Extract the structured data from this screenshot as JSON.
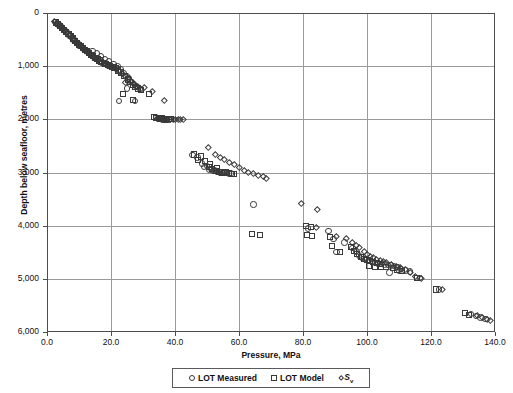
{
  "chart_data": {
    "type": "scatter",
    "title": "",
    "xlabel": "Pressure, MPa",
    "ylabel": "Depth below seafloor, metres",
    "xlim": [
      0,
      140
    ],
    "ylim": [
      0,
      6000
    ],
    "y_inverted": true,
    "grid": true,
    "legend_position": "bottom",
    "xticks": [
      "0.0",
      "20.0",
      "40.0",
      "60.0",
      "80.0",
      "100.0",
      "120.0",
      "140.0"
    ],
    "xtick_values": [
      0,
      20,
      40,
      60,
      80,
      100,
      120,
      140
    ],
    "yticks": [
      "0",
      "1,000",
      "2,000",
      "3,000",
      "4,000",
      "5,000",
      "6,000"
    ],
    "ytick_values": [
      0,
      1000,
      2000,
      3000,
      4000,
      5000,
      6000
    ],
    "series": [
      {
        "name": "LOT Measured",
        "marker": "circle",
        "points": [
          [
            2.6,
            170
          ],
          [
            3.1,
            200
          ],
          [
            3.6,
            215
          ],
          [
            4.3,
            250
          ],
          [
            5.0,
            300
          ],
          [
            5.6,
            330
          ],
          [
            6.3,
            360
          ],
          [
            7.0,
            420
          ],
          [
            7.6,
            455
          ],
          [
            8.3,
            500
          ],
          [
            9.0,
            540
          ],
          [
            9.6,
            575
          ],
          [
            10.2,
            610
          ],
          [
            10.9,
            640
          ],
          [
            11.5,
            680
          ],
          [
            12.1,
            700
          ],
          [
            12.8,
            735
          ],
          [
            13.4,
            770
          ],
          [
            14.0,
            800
          ],
          [
            14.7,
            830
          ],
          [
            15.3,
            855
          ],
          [
            16.0,
            880
          ],
          [
            16.6,
            905
          ],
          [
            17.2,
            930
          ],
          [
            17.9,
            950
          ],
          [
            18.5,
            965
          ],
          [
            19.2,
            985
          ],
          [
            19.8,
            1000
          ],
          [
            20.5,
            1015
          ],
          [
            21.1,
            1030
          ],
          [
            14.2,
            720
          ],
          [
            15.6,
            760
          ],
          [
            16.9,
            820
          ],
          [
            18.1,
            870
          ],
          [
            19.4,
            915
          ],
          [
            20.8,
            960
          ],
          [
            22.0,
            1005
          ],
          [
            23.0,
            1060
          ],
          [
            24.0,
            1130
          ],
          [
            24.8,
            1180
          ],
          [
            25.6,
            1230
          ],
          [
            26.4,
            1300
          ],
          [
            25.0,
            1420
          ],
          [
            27.2,
            1340
          ],
          [
            28.0,
            1380
          ],
          [
            29.0,
            1430
          ],
          [
            22.5,
            1650
          ],
          [
            27.5,
            1660
          ],
          [
            34.0,
            1960
          ],
          [
            34.8,
            1985
          ],
          [
            35.5,
            1995
          ],
          [
            36.2,
            2000
          ],
          [
            36.9,
            2005
          ],
          [
            37.5,
            2005
          ],
          [
            38.2,
            2000
          ],
          [
            35.0,
            1975
          ],
          [
            36.0,
            1990
          ],
          [
            37.0,
            2000
          ],
          [
            45.5,
            2670
          ],
          [
            47.0,
            2720
          ],
          [
            48.5,
            2830
          ],
          [
            50.0,
            2880
          ],
          [
            51.2,
            2930
          ],
          [
            52.3,
            2960
          ],
          [
            53.2,
            2980
          ],
          [
            54.0,
            3000
          ],
          [
            54.8,
            3010
          ],
          [
            55.5,
            3010
          ],
          [
            49.0,
            2900
          ],
          [
            50.8,
            2940
          ],
          [
            52.0,
            2970
          ],
          [
            53.5,
            2995
          ],
          [
            55.0,
            3005
          ],
          [
            56.0,
            3015
          ],
          [
            56.8,
            3020
          ],
          [
            57.5,
            3020
          ],
          [
            64.5,
            3600
          ],
          [
            81.5,
            4050
          ],
          [
            88.0,
            4100
          ],
          [
            89.5,
            4250
          ],
          [
            90.5,
            4490
          ],
          [
            93.0,
            4320
          ],
          [
            95.5,
            4420
          ],
          [
            96.5,
            4500
          ],
          [
            97.5,
            4560
          ],
          [
            98.5,
            4600
          ],
          [
            99.5,
            4630
          ],
          [
            100.5,
            4660
          ],
          [
            101.5,
            4680
          ],
          [
            102.5,
            4700
          ],
          [
            103.5,
            4710
          ],
          [
            104.5,
            4720
          ],
          [
            105.5,
            4730
          ],
          [
            106.5,
            4740
          ],
          [
            107.5,
            4750
          ],
          [
            108.5,
            4760
          ],
          [
            109.5,
            4780
          ],
          [
            110.5,
            4810
          ],
          [
            107.0,
            4880
          ],
          [
            110.0,
            4850
          ],
          [
            112.0,
            4840
          ],
          [
            113.5,
            4860
          ],
          [
            116.5,
            4980
          ],
          [
            122.5,
            5200
          ],
          [
            132.5,
            5660
          ],
          [
            134.0,
            5700
          ],
          [
            135.5,
            5730
          ],
          [
            137.0,
            5760
          ]
        ]
      },
      {
        "name": "LOT Model",
        "marker": "square",
        "points": [
          [
            2.8,
            180
          ],
          [
            3.4,
            210
          ],
          [
            4.0,
            240
          ],
          [
            4.7,
            275
          ],
          [
            5.4,
            320
          ],
          [
            6.0,
            350
          ],
          [
            6.7,
            390
          ],
          [
            7.4,
            440
          ],
          [
            8.0,
            480
          ],
          [
            8.7,
            520
          ],
          [
            9.3,
            560
          ],
          [
            10.0,
            595
          ],
          [
            10.6,
            625
          ],
          [
            11.3,
            660
          ],
          [
            11.9,
            690
          ],
          [
            12.6,
            720
          ],
          [
            13.2,
            750
          ],
          [
            13.9,
            785
          ],
          [
            14.5,
            815
          ],
          [
            15.1,
            845
          ],
          [
            15.8,
            870
          ],
          [
            16.4,
            895
          ],
          [
            17.0,
            920
          ],
          [
            17.7,
            945
          ],
          [
            18.3,
            960
          ],
          [
            19.0,
            980
          ],
          [
            19.6,
            995
          ],
          [
            20.2,
            1010
          ],
          [
            20.9,
            1025
          ],
          [
            21.5,
            1040
          ],
          [
            22.2,
            1080
          ],
          [
            23.2,
            1120
          ],
          [
            24.2,
            1180
          ],
          [
            25.2,
            1250
          ],
          [
            26.0,
            1300
          ],
          [
            26.8,
            1350
          ],
          [
            27.6,
            1390
          ],
          [
            28.4,
            1420
          ],
          [
            23.8,
            1520
          ],
          [
            27.0,
            1640
          ],
          [
            32.0,
            1530
          ],
          [
            29.5,
            1450
          ],
          [
            34.2,
            1970
          ],
          [
            35.2,
            1985
          ],
          [
            36.4,
            1995
          ],
          [
            37.2,
            2000
          ],
          [
            38.0,
            2000
          ],
          [
            38.8,
            1995
          ],
          [
            33.5,
            1955
          ],
          [
            35.8,
            1980
          ],
          [
            46.0,
            2660
          ],
          [
            48.0,
            2700
          ],
          [
            47.2,
            2760
          ],
          [
            49.5,
            2790
          ],
          [
            50.5,
            2900
          ],
          [
            51.5,
            2940
          ],
          [
            52.8,
            2965
          ],
          [
            53.8,
            2985
          ],
          [
            54.6,
            3000
          ],
          [
            55.3,
            3005
          ],
          [
            56.2,
            3010
          ],
          [
            57.0,
            3015
          ],
          [
            57.8,
            3025
          ],
          [
            58.5,
            3030
          ],
          [
            51.0,
            2850
          ],
          [
            53.0,
            2920
          ],
          [
            55.8,
            2990
          ],
          [
            64.0,
            4150
          ],
          [
            66.5,
            4180
          ],
          [
            81.0,
            4010
          ],
          [
            82.5,
            4020
          ],
          [
            81.2,
            4180
          ],
          [
            82.8,
            4190
          ],
          [
            88.5,
            4220
          ],
          [
            89.0,
            4380
          ],
          [
            91.5,
            4490
          ],
          [
            95.0,
            4400
          ],
          [
            96.0,
            4480
          ],
          [
            97.0,
            4540
          ],
          [
            98.0,
            4590
          ],
          [
            99.0,
            4620
          ],
          [
            100.0,
            4650
          ],
          [
            101.0,
            4670
          ],
          [
            102.0,
            4690
          ],
          [
            103.0,
            4705
          ],
          [
            104.0,
            4715
          ],
          [
            100.5,
            4760
          ],
          [
            102.5,
            4770
          ],
          [
            104.5,
            4775
          ],
          [
            106.0,
            4785
          ],
          [
            108.0,
            4800
          ],
          [
            109.5,
            4830
          ],
          [
            111.0,
            4850
          ],
          [
            115.5,
            4980
          ],
          [
            121.5,
            5200
          ],
          [
            130.5,
            5650
          ],
          [
            132.0,
            5680
          ]
        ]
      },
      {
        "name": "Sv",
        "marker": "diamond",
        "points": [
          [
            2.4,
            165
          ],
          [
            3.0,
            195
          ],
          [
            3.5,
            210
          ],
          [
            4.2,
            245
          ],
          [
            4.9,
            290
          ],
          [
            5.5,
            325
          ],
          [
            6.2,
            355
          ],
          [
            6.9,
            410
          ],
          [
            7.5,
            450
          ],
          [
            8.2,
            495
          ],
          [
            8.9,
            535
          ],
          [
            9.5,
            570
          ],
          [
            10.1,
            605
          ],
          [
            10.8,
            635
          ],
          [
            11.4,
            675
          ],
          [
            12.0,
            695
          ],
          [
            12.7,
            730
          ],
          [
            13.3,
            765
          ],
          [
            13.9,
            795
          ],
          [
            14.6,
            825
          ],
          [
            15.2,
            850
          ],
          [
            15.9,
            875
          ],
          [
            16.5,
            900
          ],
          [
            17.1,
            925
          ],
          [
            17.8,
            945
          ],
          [
            18.4,
            960
          ],
          [
            19.1,
            980
          ],
          [
            19.7,
            995
          ],
          [
            20.4,
            1010
          ],
          [
            21.0,
            1025
          ],
          [
            21.8,
            1060
          ],
          [
            22.6,
            1095
          ],
          [
            23.4,
            1140
          ],
          [
            24.4,
            1190
          ],
          [
            25.4,
            1240
          ],
          [
            26.2,
            1290
          ],
          [
            27.0,
            1330
          ],
          [
            27.8,
            1370
          ],
          [
            28.6,
            1400
          ],
          [
            29.4,
            1430
          ],
          [
            24.6,
            1300
          ],
          [
            30.5,
            1400
          ],
          [
            33.0,
            1470
          ],
          [
            36.5,
            1650
          ],
          [
            34.5,
            1975
          ],
          [
            35.6,
            1990
          ],
          [
            36.6,
            2000
          ],
          [
            37.6,
            2005
          ],
          [
            38.6,
            2005
          ],
          [
            39.4,
            2000
          ],
          [
            40.2,
            1995
          ],
          [
            41.0,
            1990
          ],
          [
            41.8,
            1990
          ],
          [
            42.5,
            1995
          ],
          [
            50.5,
            2530
          ],
          [
            52.5,
            2660
          ],
          [
            54.0,
            2720
          ],
          [
            55.5,
            2760
          ],
          [
            57.0,
            2800
          ],
          [
            58.5,
            2850
          ],
          [
            60.0,
            2900
          ],
          [
            61.5,
            2950
          ],
          [
            63.0,
            2990
          ],
          [
            64.5,
            3020
          ],
          [
            66.0,
            3050
          ],
          [
            67.5,
            3080
          ],
          [
            68.5,
            3100
          ],
          [
            79.5,
            3580
          ],
          [
            84.5,
            3700
          ],
          [
            84.0,
            4040
          ],
          [
            90.5,
            4200
          ],
          [
            93.5,
            4230
          ],
          [
            95.5,
            4320
          ],
          [
            96.5,
            4360
          ],
          [
            97.5,
            4400
          ],
          [
            99.0,
            4480
          ],
          [
            100.0,
            4530
          ],
          [
            101.0,
            4570
          ],
          [
            102.0,
            4600
          ],
          [
            103.0,
            4630
          ],
          [
            104.0,
            4650
          ],
          [
            105.0,
            4670
          ],
          [
            106.0,
            4690
          ],
          [
            107.5,
            4720
          ],
          [
            109.0,
            4760
          ],
          [
            110.5,
            4790
          ],
          [
            112.0,
            4830
          ],
          [
            113.5,
            4870
          ],
          [
            115.0,
            4950
          ],
          [
            117.0,
            4990
          ],
          [
            123.5,
            5200
          ],
          [
            134.5,
            5690
          ],
          [
            136.0,
            5720
          ],
          [
            137.5,
            5760
          ],
          [
            138.5,
            5780
          ]
        ]
      }
    ]
  },
  "legend": {
    "items": [
      {
        "label": "LOT Measured",
        "marker": "circle"
      },
      {
        "label": "LOT Model",
        "marker": "square"
      },
      {
        "label": "S",
        "subscript": "v",
        "marker": "diamond",
        "italic": true
      }
    ]
  }
}
